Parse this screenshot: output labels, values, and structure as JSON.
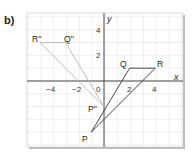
{
  "part_label": "b)",
  "axes": {
    "x_label": "x",
    "y_label": "y",
    "origin_label": "0"
  },
  "x_ticks": [
    {
      "v": -4,
      "label": "−4"
    },
    {
      "v": -2,
      "label": "−2"
    },
    {
      "v": 2,
      "label": "2"
    },
    {
      "v": 4,
      "label": "4"
    }
  ],
  "y_ticks": [
    {
      "v": 4,
      "label": "4"
    },
    {
      "v": 2,
      "label": "2"
    }
  ],
  "triangle_original": {
    "P": [
      -1,
      -4
    ],
    "Q": [
      2,
      1
    ],
    "R": [
      4,
      1
    ],
    "color": "#333333"
  },
  "triangle_image": {
    "P''": [
      0,
      -2
    ],
    "Q''": [
      -3,
      3
    ],
    "R''": [
      -5,
      3
    ],
    "color": "#b0b0b0"
  },
  "point_labels": {
    "P": "P",
    "Q": "Q",
    "R": "R",
    "P2": "P''",
    "Q2": "Q''",
    "R2": "R''"
  }
}
